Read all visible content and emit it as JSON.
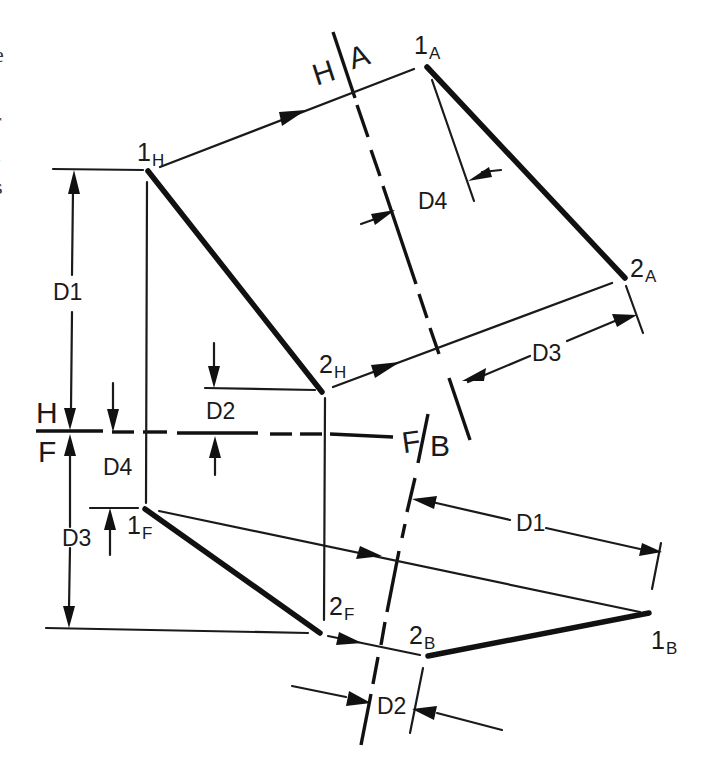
{
  "figure": {
    "type": "descriptive geometry - auxiliary views of a line",
    "edge_text": [
      "e",
      "l",
      "r",
      "t",
      "s"
    ],
    "points": {
      "p1H": {
        "num": "1",
        "sub": "H"
      },
      "p2H": {
        "num": "2",
        "sub": "H"
      },
      "p1A": {
        "num": "1",
        "sub": "A"
      },
      "p2A": {
        "num": "2",
        "sub": "A"
      },
      "p1F": {
        "num": "1",
        "sub": "F"
      },
      "p2F": {
        "num": "2",
        "sub": "F"
      },
      "p1B": {
        "num": "1",
        "sub": "B"
      },
      "p2B": {
        "num": "2",
        "sub": "B"
      }
    },
    "fold_lines": {
      "HF": {
        "top": "H",
        "bottom": "F"
      },
      "HA": {
        "left": "H",
        "right": "A"
      },
      "FB": {
        "left": "F",
        "right": "B"
      }
    },
    "dimensions": {
      "d1_left": "D1",
      "d2_mid": "D2",
      "d3_left": "D3",
      "d4_left": "D4",
      "d4_aux": "D4",
      "d3_aux": "D3",
      "d1_aux": "D1",
      "d2_aux": "D2"
    }
  }
}
